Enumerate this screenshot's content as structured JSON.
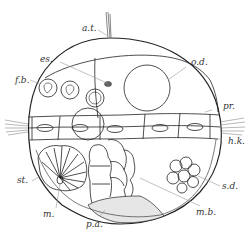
{
  "figure": {
    "line_color": "#222222",
    "leader_color": "#888888",
    "background": "#ffffff",
    "labels": {
      "at": "a.t.",
      "es": "es.",
      "fb": "f.b.",
      "od": "o.d.",
      "pr": "pr.",
      "hk": "h.k.",
      "st": "st.",
      "m": "m.",
      "sd": "s.d.",
      "mb": "m.b.",
      "pa": "p.a."
    }
  }
}
